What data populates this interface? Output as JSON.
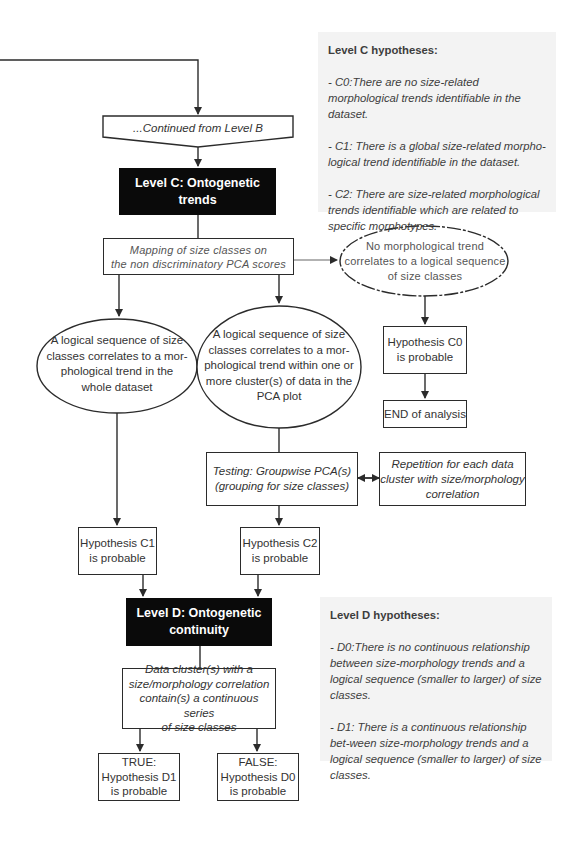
{
  "level_c": {
    "continued_label": "...Continued from Level B",
    "header": "Level C: Ontogenetic trends",
    "mapping": [
      "Mapping of size classes on",
      "the non discriminatory PCA scores"
    ],
    "no_trend": [
      "No morphological trend",
      "correlates to a logical sequence",
      "of size classes"
    ],
    "global_trend": [
      "A logical sequence of size",
      "classes correlates to a mor-",
      "phological trend in the",
      "whole dataset"
    ],
    "cluster_trend": [
      "A logical sequence of size",
      "classes correlates to a mor-",
      "phological trend within one or",
      "more cluster(s) of data in the",
      "PCA plot"
    ],
    "hyp_c0": [
      "Hypothesis C0",
      "is probable"
    ],
    "end": "END of analysis",
    "testing": [
      "Testing: Groupwise PCA(s)",
      "(grouping for size classes)"
    ],
    "repetition": [
      "Repetition for each data",
      "cluster with size/morphology",
      "correlation"
    ],
    "hyp_c1": [
      "Hypothesis C1",
      "is probable"
    ],
    "hyp_c2": [
      "Hypothesis C2",
      "is probable"
    ]
  },
  "level_d": {
    "header": [
      "Level D: Ontogenetic",
      "continuity"
    ],
    "cluster_question": [
      "Data cluster(s) with a",
      "size/morphology correlation",
      "contain(s) a continuous series",
      "of size classes"
    ],
    "true_box": [
      "TRUE:",
      "Hypothesis D1",
      "is probable"
    ],
    "false_box": [
      "FALSE:",
      "Hypothesis D0",
      "is probable"
    ]
  },
  "panel_c": {
    "title": "Level C hypotheses:",
    "items": [
      "- C0:There are no size-related morphological trends identifiable in the dataset.",
      "- C1: There is a global size-related morpho-logical trend identifiable in the dataset.",
      "- C2: There are size-related morphological trends identifiable which are related to specific morphotypes."
    ]
  },
  "panel_d": {
    "title": "Level D hypotheses:",
    "items": [
      "- D0:There is no continuous relationship between size-morphology trends and a logical sequence (smaller to larger) of size classes.",
      "- D1: There is a continuous relationship bet-ween size-morphology trends and a logical sequence (smaller to larger) of size classes."
    ]
  },
  "colors": {
    "line": "#2b2b2b",
    "header_bg": "#0a0a0a",
    "panel_bg": "#f3f3f3"
  }
}
